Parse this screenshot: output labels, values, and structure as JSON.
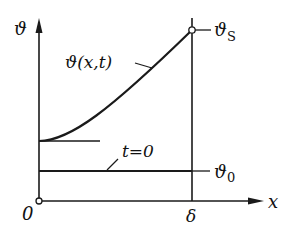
{
  "diagram": {
    "type": "temperature-profile",
    "y_axis_label": "ϑ",
    "x_axis_label": "x",
    "origin_label": "0",
    "delta_label": "δ",
    "curve_label": "ϑ(x,t)",
    "initial_label": "t=0",
    "surface_temp_label": "ϑ",
    "surface_temp_sub": "S",
    "initial_temp_label": "ϑ",
    "initial_temp_sub": "0",
    "colors": {
      "line": "#1a1a1a",
      "background": "#ffffff"
    }
  }
}
